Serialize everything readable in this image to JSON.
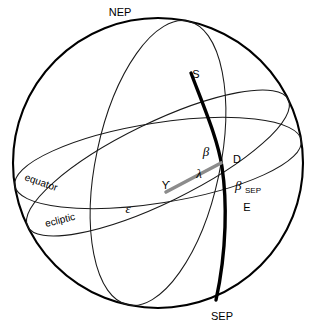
{
  "figure": {
    "kind": "celestial-sphere-diagram",
    "width": 320,
    "height": 326,
    "background_color": "#ffffff"
  },
  "colors": {
    "outline": "#000000",
    "thin_line": "#1a1a1a",
    "thick_arc": "#000000",
    "lambda_line": "#8c8c8c",
    "label_text": "#000000"
  },
  "labels": {
    "nep": "NEP",
    "sep": "SEP",
    "star": "S",
    "foot_point": "D",
    "east_point": "E",
    "equator": "equator",
    "ecliptic": "ecliptic",
    "vernal_equinox": "ϒ",
    "beta": "β",
    "beta_sep_base": "β",
    "beta_sep_sub": "SEP",
    "lambda": "λ",
    "epsilon": "ε"
  },
  "geometry": {
    "sphere_center_x": 158,
    "sphere_center_y": 163,
    "sphere_radius": 145,
    "vernal_equinox_point_x": 166,
    "vernal_equinox_point_y": 192,
    "d_point_x": 218,
    "d_point_y": 164
  },
  "elements": {
    "sphere_outline_name": "sphere-outline",
    "equator_name": "equator-great-circle",
    "ecliptic_name": "ecliptic-great-circle",
    "meridian_name": "ecliptic-meridian-arc",
    "lambda_radius_name": "lambda-radius-line"
  }
}
